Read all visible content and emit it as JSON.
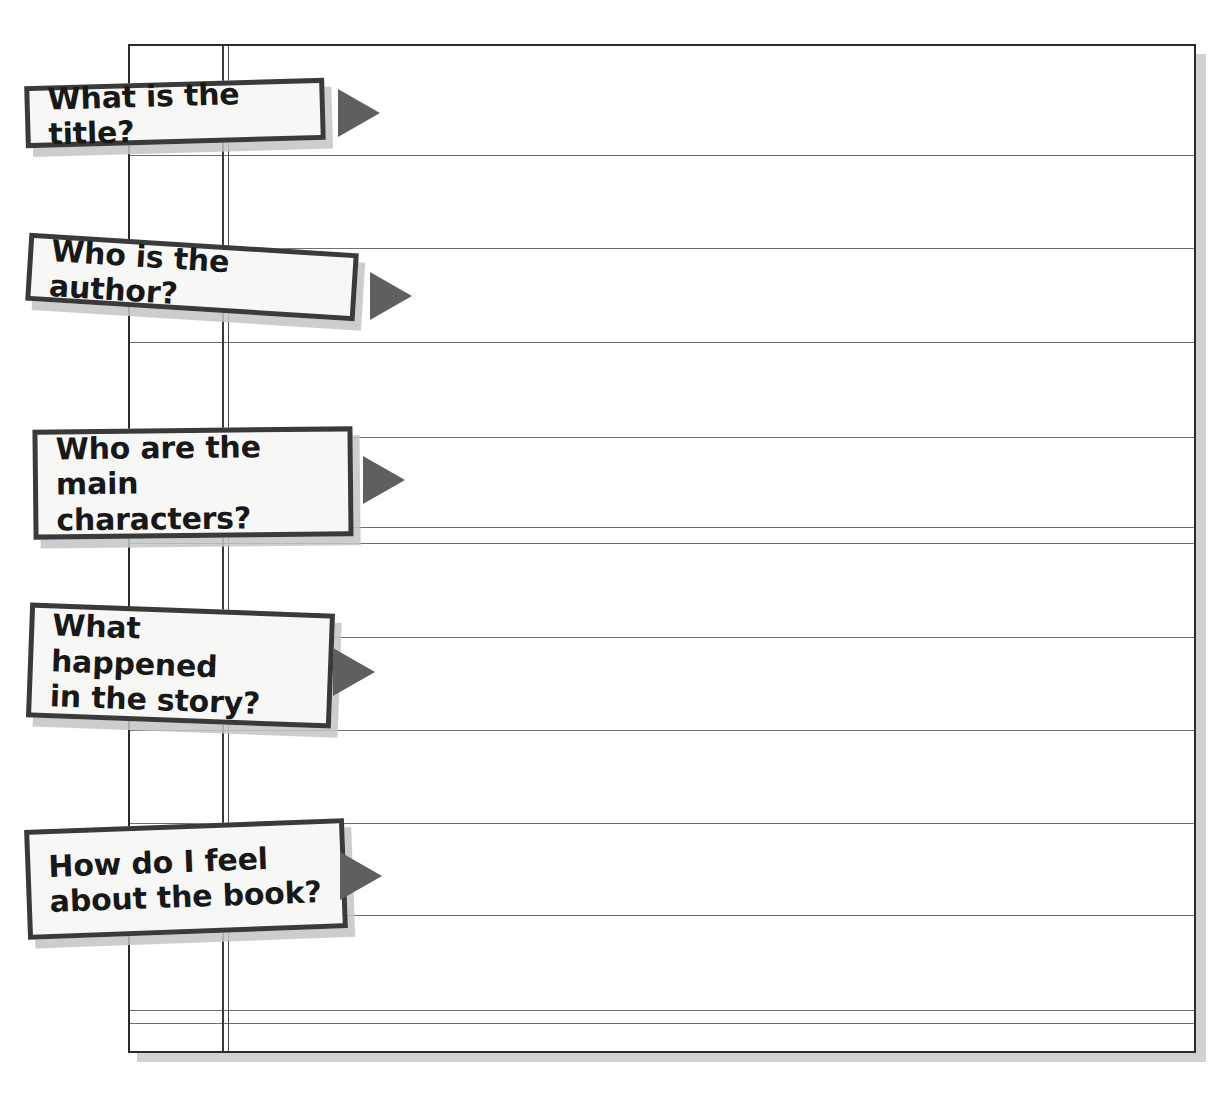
{
  "worksheet": {
    "title": "Book report worksheet",
    "paper": {
      "line_color": "#6f6f6f",
      "border_color": "#2b2b2b",
      "shadow_color": "#c9c9c9",
      "background": "#ffffff",
      "horizontal_rules": 11,
      "vertical_rules": 3
    },
    "callout_style": {
      "box_fill": "#f7f7f5",
      "box_border": "#3a3a3a",
      "shadow": "#c4c4c4",
      "arrow_color": "#5f5f5f",
      "text_color": "#181818"
    },
    "prompts": [
      {
        "id": "title",
        "label": "What is the title?",
        "arrow": "play-triangle-right"
      },
      {
        "id": "author",
        "label": "Who is the author?",
        "arrow": "play-triangle-right"
      },
      {
        "id": "characters",
        "label": "Who are the main\ncharacters?",
        "arrow": "play-triangle-right"
      },
      {
        "id": "plot",
        "label": "What happened\nin the story?",
        "arrow": "play-triangle-right"
      },
      {
        "id": "opinion",
        "label": "How do I feel\nabout the book?",
        "arrow": "play-triangle-right"
      }
    ]
  }
}
